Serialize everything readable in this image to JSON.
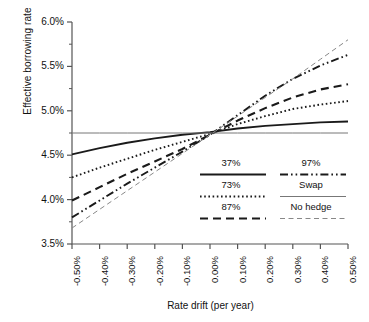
{
  "chart_data": {
    "type": "line",
    "title": "",
    "xlabel": "Rate drift (per year)",
    "ylabel": "Effective borrowing rate",
    "xlim": [
      -0.5,
      0.5
    ],
    "ylim": [
      3.5,
      6.0
    ],
    "grid": false,
    "legend_position": "inside-right",
    "xtick_labels": [
      "-0.50%",
      "-0.40%",
      "-0.30%",
      "-0.20%",
      "-0.10%",
      "0.00%",
      "0.10%",
      "0.20%",
      "0.30%",
      "0.40%",
      "0.50%"
    ],
    "xtick_values": [
      -0.5,
      -0.4,
      -0.3,
      -0.2,
      -0.1,
      0.0,
      0.1,
      0.2,
      0.3,
      0.4,
      0.5
    ],
    "ytick_labels": [
      "3.5%",
      "4.0%",
      "4.5%",
      "5.0%",
      "5.5%",
      "6.0%"
    ],
    "ytick_values": [
      3.5,
      4.0,
      4.5,
      5.0,
      5.5,
      6.0
    ],
    "x": [
      -0.5,
      -0.4,
      -0.3,
      -0.2,
      -0.1,
      0.0,
      0.1,
      0.2,
      0.3,
      0.4,
      0.5
    ],
    "series": [
      {
        "name": "37%",
        "style": "solid-bold",
        "values": [
          4.51,
          4.58,
          4.64,
          4.69,
          4.73,
          4.76,
          4.8,
          4.83,
          4.85,
          4.87,
          4.88
        ]
      },
      {
        "name": "73%",
        "style": "dotted",
        "values": [
          4.25,
          4.36,
          4.46,
          4.56,
          4.65,
          4.74,
          4.85,
          4.94,
          5.02,
          5.07,
          5.11
        ]
      },
      {
        "name": "87%",
        "style": "dashed-long",
        "values": [
          3.99,
          4.14,
          4.29,
          4.43,
          4.57,
          4.73,
          4.89,
          5.03,
          5.15,
          5.24,
          5.3
        ]
      },
      {
        "name": "97%",
        "style": "dash-dot-dot",
        "values": [
          3.8,
          3.99,
          4.18,
          4.36,
          4.54,
          4.73,
          4.95,
          5.17,
          5.36,
          5.51,
          5.63
        ]
      },
      {
        "name": "Swap",
        "style": "thin-solid",
        "values": [
          4.75,
          4.75,
          4.75,
          4.75,
          4.75,
          4.75,
          4.75,
          4.75,
          4.75,
          4.75,
          4.75
        ]
      },
      {
        "name": "No hedge",
        "style": "thin-dashed",
        "values": [
          3.68,
          3.89,
          4.1,
          4.31,
          4.52,
          4.73,
          4.94,
          5.15,
          5.36,
          5.58,
          5.8
        ]
      }
    ],
    "legend": [
      {
        "label": "37%",
        "style": "solid-bold"
      },
      {
        "label": "97%",
        "style": "dash-dot-dot"
      },
      {
        "label": "73%",
        "style": "dotted"
      },
      {
        "label": "Swap",
        "style": "thin-solid"
      },
      {
        "label": "87%",
        "style": "dashed-long"
      },
      {
        "label": "No hedge",
        "style": "thin-dashed"
      }
    ],
    "colors": {
      "line": "#1a1a1a",
      "axis": "#555555",
      "background": "#ffffff"
    }
  }
}
